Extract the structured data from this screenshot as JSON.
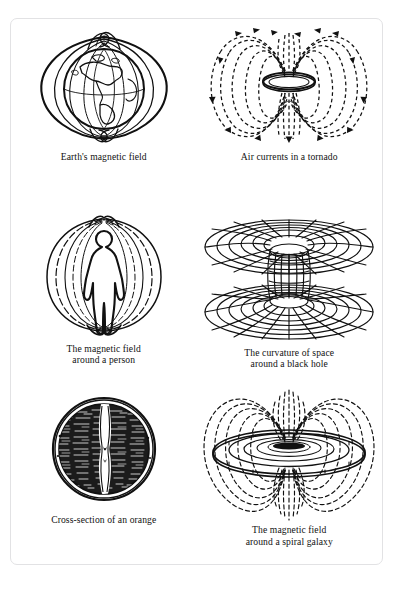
{
  "page": {
    "ghost_header": "",
    "frame_color": "#e2e2e4",
    "ink_color": "#111111",
    "background": "#ffffff"
  },
  "figures": [
    {
      "id": "earths-magnetic-field",
      "icon": "earth-globe-magnetic-field-icon",
      "caption_line1": "Earth's magnetic field",
      "caption_line2": ""
    },
    {
      "id": "air-currents-in-a-tornado",
      "icon": "tornado-air-currents-icon",
      "caption_line1": "Air currents in a tornado",
      "caption_line2": ""
    },
    {
      "id": "magnetic-field-around-a-person",
      "icon": "human-figure-magnetic-field-icon",
      "caption_line1": "The magnetic field",
      "caption_line2": "around a person"
    },
    {
      "id": "curvature-of-space-around-a-black-hole",
      "icon": "wormhole-grid-icon",
      "caption_line1": "The curvature of space",
      "caption_line2": "around a black hole"
    },
    {
      "id": "cross-section-of-an-orange",
      "icon": "orange-cross-section-icon",
      "caption_line1": "Cross-section of an orange",
      "caption_line2": ""
    },
    {
      "id": "magnetic-field-around-a-spiral-galaxy",
      "icon": "spiral-galaxy-magnetic-field-icon",
      "caption_line1": "The magnetic field",
      "caption_line2": "around a spiral galaxy"
    }
  ]
}
